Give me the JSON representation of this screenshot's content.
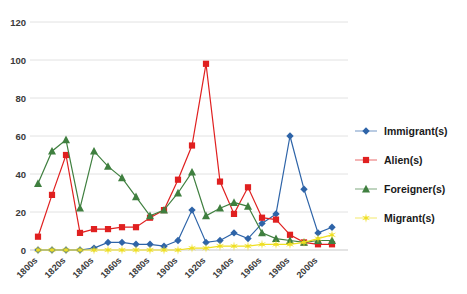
{
  "chart_data": {
    "type": "line",
    "title": "",
    "subtitle": "",
    "xlabel": "",
    "ylabel": "",
    "grid": true,
    "legend_position": "right",
    "ylim": [
      0,
      120
    ],
    "yticks": [
      0,
      20,
      40,
      60,
      80,
      100,
      120
    ],
    "ytick_labels": [
      "0",
      "20",
      "40",
      "60",
      "80",
      "100",
      "120"
    ],
    "categories": [
      "1800s",
      "1810s",
      "1820s",
      "1830s",
      "1840s",
      "1850s",
      "1860s",
      "1870s",
      "1880s",
      "1890s",
      "1900s",
      "1910s",
      "1920s",
      "1930s",
      "1940s",
      "1950s",
      "1960s",
      "1970s",
      "1980s",
      "1990s",
      "2000s",
      "2010s"
    ],
    "xtick_labels_shown": [
      "1800s",
      "1820s",
      "1840s",
      "1860s",
      "1880s",
      "1900s",
      "1920s",
      "1940s",
      "1960s",
      "1980s",
      "2000s"
    ],
    "series": [
      {
        "name": "Immigrant(s)",
        "color": "#2E64A8",
        "marker": "diamond",
        "values": [
          0,
          0,
          0,
          0,
          1,
          4,
          4,
          3,
          3,
          2,
          5,
          21,
          4,
          5,
          9,
          6,
          14,
          19,
          60,
          32,
          9,
          12
        ]
      },
      {
        "name": "Alien(s)",
        "color": "#E02020",
        "marker": "square",
        "values": [
          7,
          29,
          50,
          9,
          11,
          11,
          12,
          12,
          17,
          21,
          37,
          55,
          98,
          36,
          19,
          33,
          17,
          16,
          8,
          4,
          3,
          3
        ]
      },
      {
        "name": "Foreigner(s)",
        "color": "#3F7F3F",
        "marker": "triangle",
        "values": [
          35,
          52,
          58,
          22,
          52,
          44,
          38,
          28,
          18,
          21,
          30,
          41,
          18,
          22,
          25,
          23,
          9,
          6,
          5,
          4,
          5,
          5
        ]
      },
      {
        "name": "Migrant(s)",
        "color": "#EFDF21",
        "marker": "star",
        "values": [
          0,
          0,
          0,
          0,
          0,
          0,
          0,
          0,
          0,
          0,
          0,
          1,
          1,
          2,
          2,
          2,
          3,
          3,
          3,
          4,
          6,
          8
        ]
      }
    ]
  }
}
